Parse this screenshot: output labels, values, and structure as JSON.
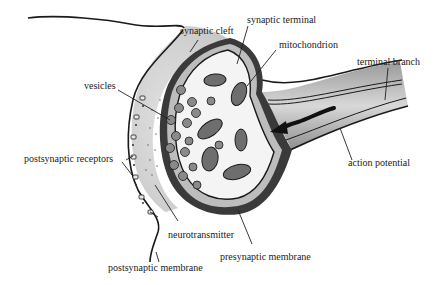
{
  "diagram": {
    "labels": {
      "synaptic_cleft": "synaptic cleft",
      "synaptic_terminal": "synaptic terminal",
      "mitochondrion": "mitochondrion",
      "terminal_branch": "terminal branch",
      "vesicles": "vesicles",
      "postsynaptic_receptors": "postsynaptic receptors",
      "action_potential": "action potential",
      "neurotransmitter": "neurotransmitter",
      "presynaptic_membrane": "presynaptic membrane",
      "postsynaptic_membrane": "postsynaptic membrane"
    },
    "colors": {
      "outline": "#1a1a1a",
      "membrane_dark": "#2b2b2b",
      "cleft_fill": "#d4d4d4",
      "terminal_fill": "#f2f2f2",
      "mitochondrion_fill": "#6e6e6e",
      "vesicle_fill": "#8a8a8a"
    }
  }
}
